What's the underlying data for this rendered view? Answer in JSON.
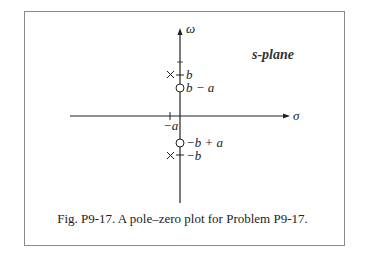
{
  "figure": {
    "caption": "Fig. P9-17. A pole–zero plot for Problem P9-17.",
    "plane_label": "s-plane",
    "axes": {
      "vertical_label": "ω",
      "horizontal_label": "σ"
    },
    "tick_labels": {
      "neg_a": "−a"
    },
    "poles": [
      {
        "label": "b",
        "position": "+b"
      },
      {
        "label": "−b",
        "position": "−b"
      }
    ],
    "zeros": [
      {
        "label": "b − a",
        "position": "b−a"
      },
      {
        "label": "−b + a",
        "position": "−b+a"
      }
    ],
    "colors": {
      "ink": "#222222",
      "frame": "#8a8a8a"
    }
  }
}
